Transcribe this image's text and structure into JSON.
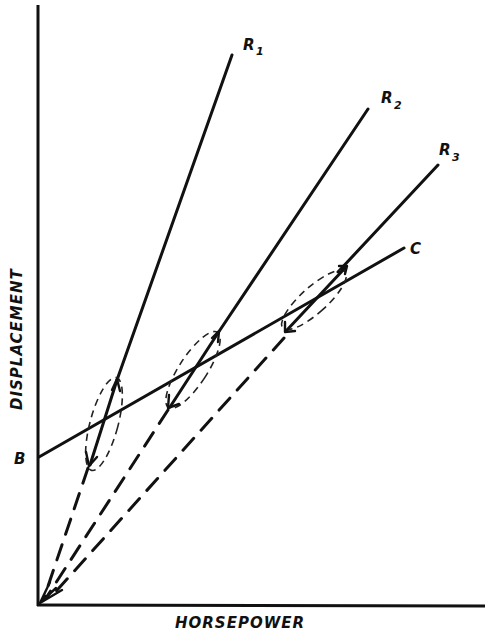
{
  "diagram": {
    "x_axis_label": "HORSEPOWER",
    "y_axis_label": "DISPLACEMENT",
    "intercept_label": "B",
    "curve_label": "C",
    "lines": [
      {
        "id": "R1",
        "label": "R",
        "subscript": "1"
      },
      {
        "id": "R2",
        "label": "R",
        "subscript": "2"
      },
      {
        "id": "R3",
        "label": "R",
        "subscript": "3"
      }
    ],
    "colors": {
      "ink": "#111111",
      "background": "#ffffff"
    }
  }
}
